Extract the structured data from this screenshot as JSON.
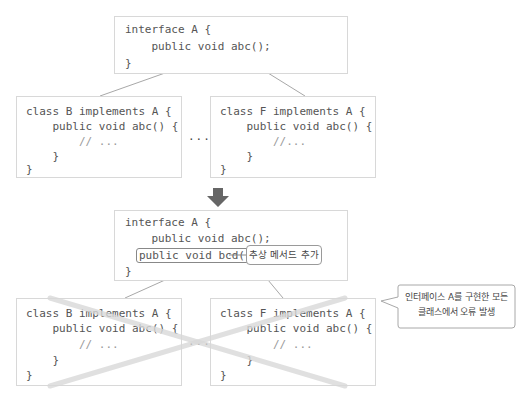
{
  "top": {
    "interface_box": {
      "lines": [
        "interface A {",
        "    public void abc();",
        "}"
      ]
    },
    "class_b_box": {
      "lines": [
        "class B implements A {",
        "    public void abc() {",
        "        // ...",
        "    }",
        "}"
      ]
    },
    "ellipsis": "...",
    "class_f_box": {
      "lines": [
        "class F implements A {",
        "    public void abc() {",
        "        //...",
        "    }",
        "}"
      ]
    }
  },
  "arrow": {
    "direction": "down",
    "icon": "down-arrow-icon",
    "color": "#666666"
  },
  "bottom": {
    "interface_box": {
      "lines": [
        "interface A {",
        "    public void abc();",
        "    public void bcd();",
        "}"
      ],
      "highlighted_line": "public void bcd();"
    },
    "callout_add_method": "추상 메서드 추가",
    "class_b_box": {
      "lines": [
        "class B implements A {",
        "    public void abc() {",
        "        // ...",
        "    }",
        "}"
      ]
    },
    "ellipsis": "...",
    "class_f_box": {
      "lines": [
        "class F implements A {",
        "    public void abc() {",
        "        // ...",
        "    }",
        "}"
      ]
    },
    "callout_error": {
      "line1": "인터페이스 A를 구현한 모든",
      "line2": "클래스에서 오류 발생"
    },
    "cross_mark_color": "#e2e2e2"
  }
}
